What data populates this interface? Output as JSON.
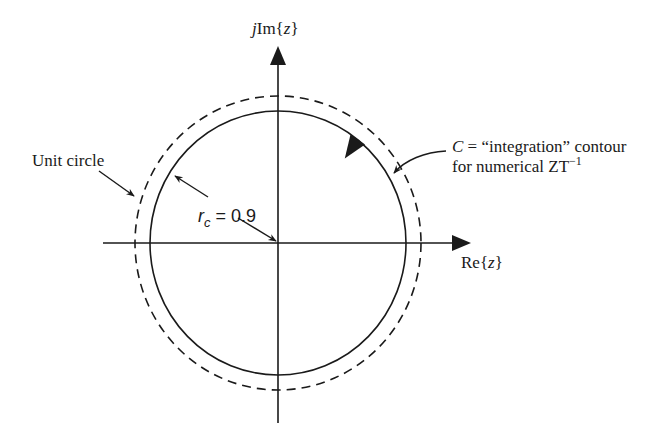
{
  "diagram": {
    "type": "z-plane contour diagram",
    "axes": {
      "imag_label_prefix": "j",
      "imag_label_main": "Im{",
      "imag_label_var": "z",
      "imag_label_suffix": "}",
      "real_label_main": "Re{",
      "real_label_var": "z",
      "real_label_suffix": "}"
    },
    "unit_circle": {
      "label": "Unit circle",
      "style": "dashed",
      "radius": 1.0
    },
    "contour": {
      "symbol": "C",
      "label_line1_rest": " = “integration” contour",
      "label_line2": "for numerical ZT",
      "label_line2_sup": "−1",
      "style": "solid",
      "direction": "counterclockwise"
    },
    "radius_label": {
      "symbol": "r",
      "subscript": "c",
      "equals": " = 0.9",
      "value": 0.9
    },
    "colors": {
      "ink": "#1a1a1a",
      "background": "#ffffff"
    }
  }
}
